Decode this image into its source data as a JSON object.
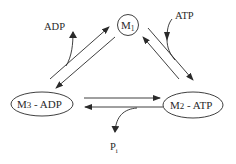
{
  "diagram": {
    "type": "reaction-cycle",
    "colors": {
      "stroke": "#2a2a2a",
      "background": "#ffffff"
    },
    "nodes": [
      {
        "id": "m1",
        "base": "M",
        "sub": "1",
        "suffix": "",
        "shape": "circle"
      },
      {
        "id": "m2",
        "base": "M",
        "sub": "2",
        "suffix": " - ATP",
        "shape": "ellipse"
      },
      {
        "id": "m3",
        "base": "M",
        "sub": "3",
        "suffix": " - ADP",
        "shape": "ellipse"
      }
    ],
    "labels": {
      "atp": "ATP",
      "adp": "ADP",
      "pi_base": "P",
      "pi_sub": "i"
    },
    "edges": [
      {
        "from": "m3",
        "to": "m1",
        "note": "forward, releases ADP"
      },
      {
        "from": "m1",
        "to": "m3",
        "note": "reverse"
      },
      {
        "from": "m1",
        "to": "m2",
        "note": "forward, binds ATP"
      },
      {
        "from": "m2",
        "to": "m1",
        "note": "reverse"
      },
      {
        "from": "m3",
        "to": "m2",
        "note": "forward"
      },
      {
        "from": "m2",
        "to": "m3",
        "note": "reverse, releases Pi"
      }
    ]
  }
}
